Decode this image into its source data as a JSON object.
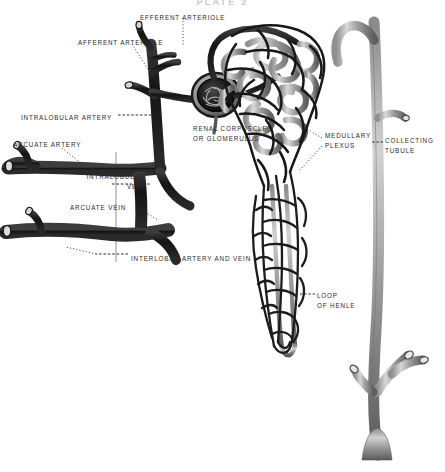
{
  "plate": {
    "title": "PLATE 2",
    "background_color": "#ffffff",
    "ink_dark": "#1d1d1d",
    "ink_mid": "#4a4a4a",
    "ink_light": "#9b9b9b",
    "label_color": "#2b2b2b",
    "width": 445,
    "height": 472
  },
  "labels": [
    {
      "id": "efferent-arteriole",
      "text": "EFFERENT ARTERIOLE",
      "x": 140,
      "y": 13,
      "align": "left",
      "leader": "dotted-vertical"
    },
    {
      "id": "afferent-arteriole",
      "text": "AFFERENT ARTERIOLE",
      "x": 78,
      "y": 38,
      "align": "left",
      "leader": "dotted-diagonal"
    },
    {
      "id": "intralobular-artery",
      "text": "INTRALOBULAR ARTERY",
      "x": 21,
      "y": 113,
      "align": "left",
      "leader": "dashed-horizontal"
    },
    {
      "id": "arcuate-artery",
      "text": "ARCUATE ARTERY",
      "x": 13,
      "y": 140,
      "align": "left",
      "leader": "dotted-diagonal"
    },
    {
      "id": "renal-corpuscle",
      "text": "RENAL CORPUSCLE\nOR GLOMERULUS",
      "x": 193,
      "y": 124,
      "align": "left",
      "leader": "dotted-vertical"
    },
    {
      "id": "medullary-plexus",
      "text": "MEDULLARY\nPLEXUS",
      "x": 325,
      "y": 131,
      "align": "left",
      "leader": "dotted-diagonal"
    },
    {
      "id": "collecting-tubule",
      "text": "COLLECTING\nTUBULE",
      "x": 385,
      "y": 136,
      "align": "left",
      "leader": "dashed-horizontal"
    },
    {
      "id": "intralobular-vein",
      "text": "INTRALOBULAR\nVEIN",
      "x": 61,
      "y": 172,
      "align": "left",
      "leader": "dashed-horizontal"
    },
    {
      "id": "arcuate-vein",
      "text": "ARCUATE VEIN",
      "x": 70,
      "y": 203,
      "align": "left",
      "leader": "dotted-diagonal"
    },
    {
      "id": "interlobar-artery-and-vein",
      "text": "INTERLOBAR ARTERY AND VEIN",
      "x": 131,
      "y": 254,
      "align": "left",
      "leader": "dashed-horizontal"
    },
    {
      "id": "loop-of-henle",
      "text": "LOOP\nOF HENLE",
      "x": 317,
      "y": 291,
      "align": "left",
      "leader": "dashed-horizontal"
    }
  ],
  "structures": [
    {
      "id": "glomerulus",
      "name": "renal corpuscle / glomerulus tuft",
      "tone": "dark"
    },
    {
      "id": "afferent-arteriole-vessel",
      "name": "afferent arteriole",
      "tone": "dark"
    },
    {
      "id": "efferent-arteriole-vessel",
      "name": "efferent arteriole",
      "tone": "dark"
    },
    {
      "id": "intralobular-artery-vessel",
      "name": "intralobular artery",
      "tone": "dark"
    },
    {
      "id": "arcuate-artery-vessel",
      "name": "arcuate artery",
      "tone": "dark"
    },
    {
      "id": "intralobular-vein-vessel",
      "name": "intralobular vein",
      "tone": "dark"
    },
    {
      "id": "arcuate-vein-vessel",
      "name": "arcuate vein",
      "tone": "dark"
    },
    {
      "id": "interlobar-vessels",
      "name": "interlobar artery and vein",
      "tone": "dark"
    },
    {
      "id": "peritubular-capillary-network",
      "name": "cortical peritubular capillary plexus",
      "tone": "dark"
    },
    {
      "id": "convoluted-tubule",
      "name": "convoluted tubule coils",
      "tone": "light"
    },
    {
      "id": "medullary-plexus-network",
      "name": "medullary (vasa recta) plexus",
      "tone": "dark"
    },
    {
      "id": "loop-of-henle-limbs",
      "name": "loop of Henle",
      "tone": "light"
    },
    {
      "id": "collecting-tubule-tree",
      "name": "collecting tubule",
      "tone": "light"
    }
  ]
}
